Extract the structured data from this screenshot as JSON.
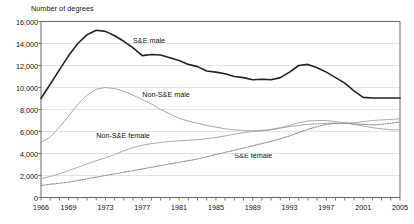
{
  "chart_data": {
    "type": "line",
    "title": "",
    "ylabel": "Number of degrees",
    "xlabel": "",
    "ylim": [
      0,
      16000
    ],
    "xlim": [
      1966,
      2005
    ],
    "ytick_labels": [
      "16,000",
      "14,000",
      "12,000",
      "10,000",
      "8,000",
      "6,000",
      "4,000",
      "2,000",
      "0"
    ],
    "ytick_values": [
      16000,
      14000,
      12000,
      10000,
      8000,
      6000,
      4000,
      2000,
      0
    ],
    "xtick_labels": [
      "1966",
      "1969",
      "1973",
      "1977",
      "1981",
      "1985",
      "1989",
      "1993",
      "1997",
      "2001",
      "2005"
    ],
    "xtick_values": [
      1966,
      1969,
      1973,
      1977,
      1981,
      1985,
      1989,
      1993,
      1997,
      2001,
      2005
    ],
    "grid": "horizontal",
    "legend_position": "inline-annotations",
    "x": [
      1966,
      1967,
      1968,
      1969,
      1970,
      1971,
      1972,
      1973,
      1974,
      1975,
      1976,
      1977,
      1978,
      1979,
      1980,
      1981,
      1982,
      1983,
      1984,
      1985,
      1986,
      1987,
      1988,
      1989,
      1990,
      1991,
      1992,
      1993,
      1994,
      1995,
      1996,
      1997,
      1998,
      1999,
      2000,
      2001,
      2002,
      2003,
      2004,
      2005
    ],
    "series": [
      {
        "name": "S&E male",
        "style": "solid-thick",
        "color": "#222222",
        "values": [
          9000,
          10300,
          11600,
          12900,
          14000,
          14800,
          15200,
          15100,
          14700,
          14200,
          13600,
          12900,
          13000,
          12950,
          12700,
          12450,
          12100,
          11900,
          11500,
          11400,
          11250,
          11000,
          10900,
          10700,
          10750,
          10700,
          10900,
          11400,
          12000,
          12100,
          11800,
          11400,
          10900,
          10400,
          9700,
          9100,
          9050,
          9050,
          9050,
          9050
        ]
      },
      {
        "name": "Non-S&E male",
        "style": "solid-thin",
        "color": "#a0a0a0",
        "values": [
          5000,
          5500,
          6400,
          7400,
          8500,
          9300,
          9850,
          10000,
          9900,
          9650,
          9300,
          8900,
          8500,
          8000,
          7600,
          7200,
          6950,
          6750,
          6550,
          6400,
          6250,
          6150,
          6100,
          6050,
          6100,
          6200,
          6350,
          6550,
          6800,
          6950,
          7000,
          7000,
          6900,
          6800,
          6650,
          6500,
          6350,
          6250,
          6150,
          6150
        ]
      },
      {
        "name": "Non-S&E female",
        "style": "solid-thin",
        "color": "#a0a0a0",
        "values": [
          1700,
          1900,
          2150,
          2450,
          2750,
          3050,
          3350,
          3600,
          3900,
          4250,
          4550,
          4750,
          4900,
          5000,
          5100,
          5150,
          5200,
          5250,
          5350,
          5450,
          5600,
          5750,
          5900,
          6000,
          6050,
          6150,
          6300,
          6450,
          6550,
          6650,
          6700,
          6750,
          6750,
          6750,
          6800,
          6900,
          7000,
          7050,
          7100,
          7150
        ]
      },
      {
        "name": "S&E female",
        "style": "dotted",
        "color": "#8a8a8a",
        "values": [
          1100,
          1200,
          1300,
          1400,
          1550,
          1700,
          1850,
          2000,
          2150,
          2300,
          2450,
          2600,
          2750,
          2900,
          3050,
          3200,
          3350,
          3500,
          3700,
          3900,
          4100,
          4300,
          4500,
          4700,
          4900,
          5100,
          5350,
          5600,
          5900,
          6200,
          6450,
          6650,
          6750,
          6750,
          6700,
          6650,
          6600,
          6650,
          6750,
          6850
        ]
      }
    ],
    "annotations": [
      {
        "text": "S&E male",
        "x": 1976,
        "y": 14300
      },
      {
        "text": "Non-S&E male",
        "x": 1977,
        "y": 9450
      },
      {
        "text": "Non-S&E female",
        "x": 1972,
        "y": 5700
      },
      {
        "text": "S&E female",
        "x": 1987,
        "y": 3900
      }
    ]
  }
}
